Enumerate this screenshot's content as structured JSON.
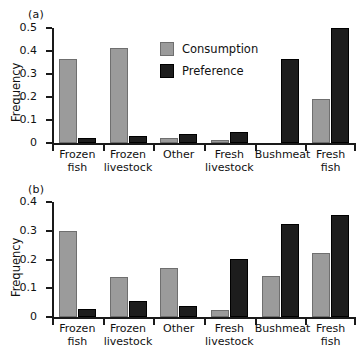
{
  "figure": {
    "background": "#ffffff",
    "series_colors": {
      "consumption": "#9b9b9b",
      "preference": "#1d1d1d"
    }
  },
  "panels": [
    {
      "tag": "(a)",
      "ylabel": "Frequency",
      "yticks": [
        "0",
        "0.1",
        "0.2",
        "0.3",
        "0.4",
        "0.5"
      ],
      "legend": {
        "consumption": "Consumption",
        "preference": "Preference"
      }
    },
    {
      "tag": "(b)",
      "ylabel": "Frequency",
      "yticks": [
        "0",
        "0.1",
        "0.2",
        "0.3",
        "0.4"
      ]
    }
  ],
  "chart_data": [
    {
      "type": "bar",
      "title": "(a)",
      "xlabel": "",
      "ylabel": "Frequency",
      "ylim": [
        0,
        0.5
      ],
      "yticks": [
        0,
        0.1,
        0.2,
        0.3,
        0.4,
        0.5
      ],
      "grid": false,
      "legend_position": "upper-center",
      "categories": [
        "Frozen fish",
        "Frozen livestock",
        "Other",
        "Fresh livestock",
        "Bushmeat",
        "Fresh fish"
      ],
      "category_lines": [
        [
          "Frozen",
          "fish"
        ],
        [
          "Frozen",
          "livestock"
        ],
        [
          "Other",
          ""
        ],
        [
          "Fresh",
          "livestock"
        ],
        [
          "Bushmeat",
          ""
        ],
        [
          "Fresh",
          "fish"
        ]
      ],
      "series": [
        {
          "name": "Consumption",
          "color": "#9b9b9b",
          "values": [
            0.365,
            0.415,
            0.02,
            0.012,
            0.0,
            0.192
          ]
        },
        {
          "name": "Preference",
          "color": "#1d1d1d",
          "values": [
            0.021,
            0.029,
            0.039,
            0.047,
            0.365,
            0.5
          ]
        }
      ]
    },
    {
      "type": "bar",
      "title": "(b)",
      "xlabel": "",
      "ylabel": "Frequency",
      "ylim": [
        0,
        0.4
      ],
      "yticks": [
        0,
        0.1,
        0.2,
        0.3,
        0.4
      ],
      "grid": false,
      "legend_position": "none",
      "categories": [
        "Frozen fish",
        "Frozen livestock",
        "Other",
        "Fresh livestock",
        "Bushmeat",
        "Fresh fish"
      ],
      "category_lines": [
        [
          "Frozen",
          "fish"
        ],
        [
          "Frozen",
          "livestock"
        ],
        [
          "Other",
          ""
        ],
        [
          "Fresh",
          "livestock"
        ],
        [
          "Bushmeat",
          ""
        ],
        [
          "Fresh",
          "fish"
        ]
      ],
      "series": [
        {
          "name": "Consumption",
          "color": "#9b9b9b",
          "values": [
            0.299,
            0.14,
            0.171,
            0.026,
            0.143,
            0.222
          ]
        },
        {
          "name": "Preference",
          "color": "#1d1d1d",
          "values": [
            0.027,
            0.055,
            0.04,
            0.201,
            0.323,
            0.355
          ]
        }
      ]
    }
  ]
}
